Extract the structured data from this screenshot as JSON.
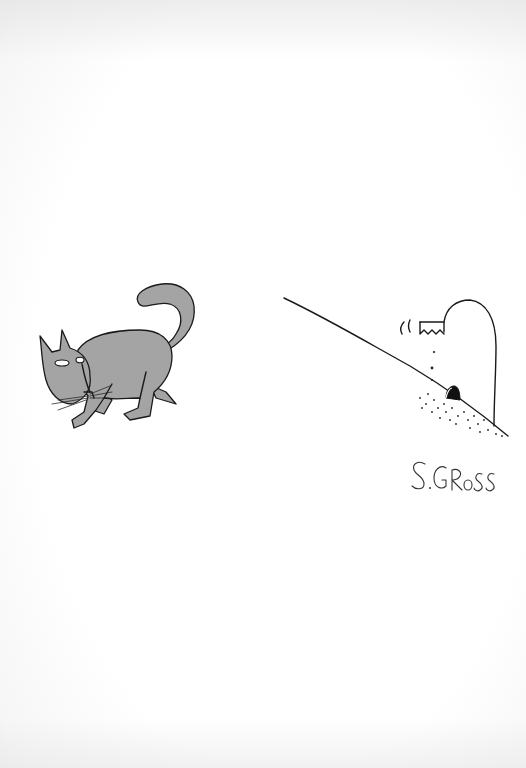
{
  "cartoon": {
    "signature": "S.GROSS",
    "subjects": [
      "cat",
      "mouse-hole-with-mouse"
    ],
    "colors": {
      "paper": "#ffffff",
      "ink": "#1a1a1a",
      "cat_wash": "#a4a4a4"
    }
  }
}
